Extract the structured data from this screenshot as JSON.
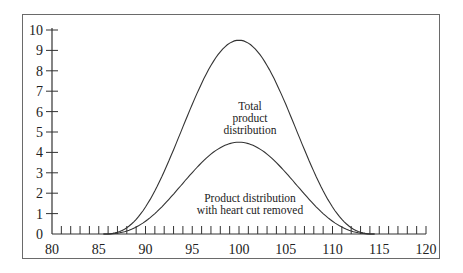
{
  "chart_data": {
    "type": "line",
    "title": "",
    "xlabel": "",
    "ylabel": "",
    "xlim": [
      80,
      120
    ],
    "ylim": [
      0,
      10
    ],
    "x_ticks": [
      80,
      85,
      90,
      95,
      100,
      105,
      110,
      115,
      120
    ],
    "y_ticks": [
      0,
      1,
      2,
      3,
      4,
      5,
      6,
      7,
      8,
      9,
      10
    ],
    "grid": false,
    "series": [
      {
        "name": "Total product distribution",
        "peak_x": 100,
        "peak_y": 9.5,
        "start_x": 85.5,
        "end_x": 114.5
      },
      {
        "name": "Product distribution with heart cut removed",
        "peak_x": 100,
        "peak_y": 4.5,
        "start_x": 85.5,
        "end_x": 114.5
      }
    ],
    "annotations": [
      {
        "text": "Total product distribution",
        "lines": [
          "Total",
          "product",
          "distribution"
        ]
      },
      {
        "text": "Product distribution with heart cut removed",
        "lines": [
          "Product distribution",
          "with heart cut removed"
        ]
      }
    ]
  },
  "labels": {
    "total_1": "Total",
    "total_2": "product",
    "total_3": "distribution",
    "heart_1": "Product distribution",
    "heart_2": "with heart cut removed"
  }
}
